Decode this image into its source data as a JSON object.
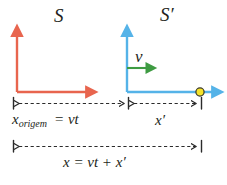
{
  "diagram": {
    "type": "physics-reference-frame-diagram",
    "topic": "Galilean transformation",
    "background_color": "#ffffff",
    "width": 227,
    "height": 185,
    "frames": {
      "rest": {
        "label": "S",
        "axis_color": "#E8654E",
        "origin": {
          "x": 17,
          "y": 92
        },
        "y_axis_tip": {
          "x": 17,
          "y": 30
        },
        "x_axis_tip": {
          "x": 95,
          "y": 92
        }
      },
      "moving": {
        "label": "S′",
        "axis_color": "#55B3E8",
        "origin": {
          "x": 127,
          "y": 92
        },
        "y_axis_tip": {
          "x": 127,
          "y": 30
        },
        "x_axis_tip": {
          "x": 222,
          "y": 92
        }
      }
    },
    "velocity_vector": {
      "label": "v",
      "color": "#3E9B42",
      "start": {
        "x": 127,
        "y": 68
      },
      "end": {
        "x": 155,
        "y": 68
      }
    },
    "event_point": {
      "label": "event-marker",
      "fill_color": "#F5E32A",
      "stroke_color": "#3a3a2a",
      "x": 200,
      "y": 92,
      "radius": 4
    },
    "measurements": [
      {
        "name": "x-origem",
        "label_main": "x",
        "label_subscript": "origem",
        "label_equation": "= vt",
        "from_x": 17,
        "to_x": 127,
        "y": 103
      },
      {
        "name": "x-prime",
        "label_main": "x′",
        "from_x": 127,
        "to_x": 200,
        "y": 103
      },
      {
        "name": "x-total",
        "label_equation": "x = vt + x′",
        "from_x": 17,
        "to_x": 200,
        "y": 146
      }
    ],
    "dash_color": "#2b2b2b"
  }
}
